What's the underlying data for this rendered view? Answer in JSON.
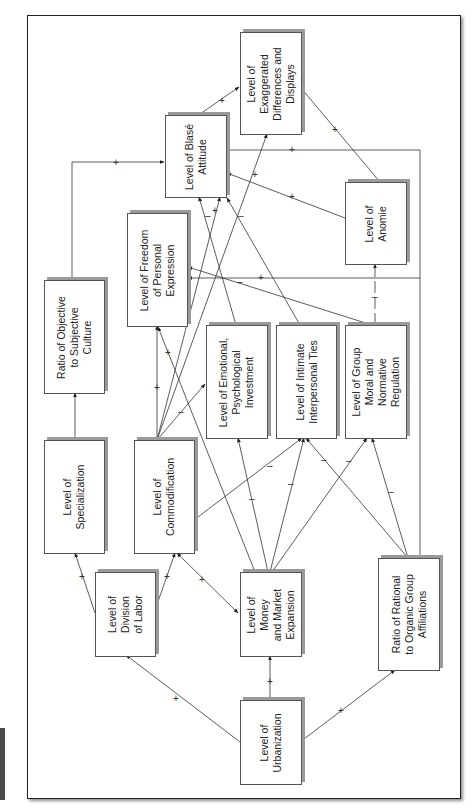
{
  "diagram": {
    "orientation": "rotated-90-counterclockwise",
    "side_tab_color": "#4a4a4a",
    "nodes": [
      {
        "id": "urbanization",
        "label": "Level of\nUrbanization",
        "box": [
          240,
          700,
          60,
          83
        ]
      },
      {
        "id": "division",
        "label": "Level of\nDivision\nof Labor",
        "box": [
          95,
          572,
          59,
          83
        ]
      },
      {
        "id": "money",
        "label": "Level of\nMoney\nand Market\nExpansion",
        "box": [
          240,
          572,
          60,
          83
        ]
      },
      {
        "id": "rational",
        "label": "Ratio of Rational\nto Organic Group\nAffiliations",
        "box": [
          378,
          558,
          60,
          111
        ]
      },
      {
        "id": "specialization",
        "label": "Level of\nSpecialization",
        "box": [
          44,
          440,
          59,
          112
        ]
      },
      {
        "id": "commodification",
        "label": "Level of\nCommodification",
        "box": [
          134,
          440,
          59,
          112
        ]
      },
      {
        "id": "ratio_objective",
        "label": "Ratio of Objective\nto Subjective\nCulture",
        "box": [
          44,
          280,
          59,
          112
        ]
      },
      {
        "id": "freedom",
        "label": "Level of Freedom\nof Personal\nExpression",
        "box": [
          127,
          213,
          59,
          112
        ]
      },
      {
        "id": "emotional",
        "label": "Level of Emotional,\nPsychological\nInvestment",
        "box": [
          206,
          325,
          60,
          112
        ]
      },
      {
        "id": "intimate",
        "label": "Level of Intimate\nInterpersonal Ties",
        "box": [
          276,
          325,
          59,
          112
        ]
      },
      {
        "id": "group_moral",
        "label": "Level of Group\nMoral and\nNormative\nRegulation",
        "box": [
          345,
          325,
          60,
          112
        ]
      },
      {
        "id": "anomie",
        "label": "Level of\nAnomie",
        "box": [
          345,
          182,
          60,
          81
        ]
      },
      {
        "id": "blase",
        "label": "Level of Blasé\nAttitude",
        "box": [
          165,
          115,
          60,
          81
        ]
      },
      {
        "id": "exaggerated",
        "label": "Level of\nExaggerated\nDifferences and\nDisplays",
        "box": [
          240,
          32,
          60,
          101
        ]
      }
    ],
    "edges": [
      {
        "from": "urbanization",
        "to": "division",
        "sign": "+"
      },
      {
        "from": "urbanization",
        "to": "money",
        "sign": "+"
      },
      {
        "from": "urbanization",
        "to": "rational",
        "sign": "+"
      },
      {
        "from": "division",
        "to": "specialization",
        "sign": "+"
      },
      {
        "from": "division",
        "to": "commodification",
        "sign": "+"
      },
      {
        "from": "money",
        "to": "commodification",
        "sign": "+",
        "bidirectional": true
      },
      {
        "from": "specialization",
        "to": "ratio_objective",
        "sign": ""
      },
      {
        "from": "ratio_objective",
        "to": "blase",
        "sign": "+"
      },
      {
        "from": "commodification",
        "to": "freedom",
        "sign": "+"
      },
      {
        "from": "commodification",
        "to": "emotional",
        "sign": "–"
      },
      {
        "from": "commodification",
        "to": "intimate",
        "sign": "–"
      },
      {
        "from": "commodification",
        "to": "blase",
        "sign": "+"
      },
      {
        "from": "commodification",
        "to": "exaggerated",
        "sign": "+"
      },
      {
        "from": "money",
        "to": "emotional",
        "sign": "–"
      },
      {
        "from": "money",
        "to": "intimate",
        "sign": "–"
      },
      {
        "from": "money",
        "to": "group_moral",
        "sign": "–"
      },
      {
        "from": "money",
        "to": "freedom",
        "sign": "+"
      },
      {
        "from": "rational",
        "to": "intimate",
        "sign": "–"
      },
      {
        "from": "rational",
        "to": "group_moral",
        "sign": "–"
      },
      {
        "from": "rational",
        "to": "freedom",
        "sign": "+"
      },
      {
        "from": "rational",
        "to": "blase",
        "sign": "+"
      },
      {
        "from": "group_moral",
        "to": "freedom",
        "sign": "–"
      },
      {
        "from": "group_moral",
        "to": "anomie",
        "sign": "–"
      },
      {
        "from": "emotional",
        "to": "blase",
        "sign": "–"
      },
      {
        "from": "intimate",
        "to": "blase",
        "sign": "–"
      },
      {
        "from": "anomie",
        "to": "blase",
        "sign": "+"
      },
      {
        "from": "anomie",
        "to": "exaggerated",
        "sign": "+"
      },
      {
        "from": "blase",
        "to": "exaggerated",
        "sign": "+"
      }
    ]
  },
  "signs": {
    "plus": "+",
    "minus": "–"
  }
}
